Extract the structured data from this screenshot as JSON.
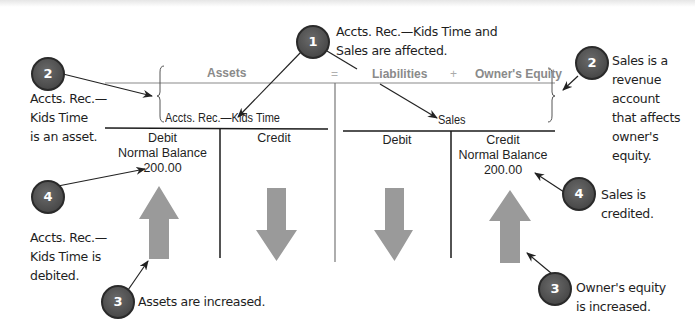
{
  "equation": {
    "assets": "Assets",
    "equals": "=",
    "liabilities": "Liabilities",
    "plus": "+",
    "owners_equity": "Owner's Equity"
  },
  "left_account": {
    "name": "Accts. Rec.—Kids Time",
    "debit_label": "Debit",
    "debit_sublabel": "Normal Balance",
    "debit_amount": "200.00",
    "credit_label": "Credit",
    "debit_arrow": "up-arrow",
    "credit_arrow": "down-arrow"
  },
  "right_account": {
    "name": "Sales",
    "debit_label": "Debit",
    "credit_label": "Credit",
    "credit_sublabel": "Normal Balance",
    "credit_amount": "200.00",
    "debit_arrow": "down-arrow",
    "credit_arrow": "up-arrow"
  },
  "callouts": [
    {
      "number": "1",
      "lines": [
        "Accts. Rec.—Kids Time and",
        "Sales are affected."
      ]
    },
    {
      "number": "2",
      "lines": [
        "Accts. Rec.—",
        "Kids Time",
        "is an asset."
      ]
    },
    {
      "number": "2",
      "lines": [
        "Sales is a",
        "revenue",
        "account",
        "that affects",
        "owner's",
        "equity."
      ]
    },
    {
      "number": "4",
      "lines": [
        "Accts. Rec.—",
        "Kids Time is",
        "debited."
      ]
    },
    {
      "number": "4",
      "lines": [
        "Sales is",
        "credited."
      ]
    },
    {
      "number": "3",
      "lines": [
        "Assets are increased."
      ]
    },
    {
      "number": "3",
      "lines": [
        "Owner's equity",
        "is increased."
      ]
    }
  ],
  "colors": {
    "badge": "#4a4a4a",
    "arrow_fill": "#9a9a9a",
    "header_text": "#8a8a8a",
    "line": "#1a1a1a"
  }
}
